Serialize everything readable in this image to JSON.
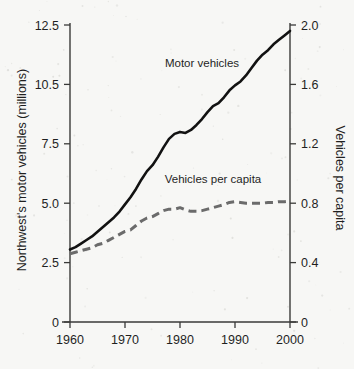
{
  "chart_data": {
    "type": "line",
    "title": "",
    "subtitle": "",
    "xlabel": "",
    "ylabel": "Northwest's motor vehicles (millions)",
    "y2label": "Vehicles per capita",
    "grid": false,
    "legend_position": "inline-annotations",
    "xlim": [
      1960,
      2000
    ],
    "ylim": [
      0,
      12.5
    ],
    "y2lim": [
      0,
      2.0
    ],
    "xticks": [
      1960,
      1970,
      1980,
      1990,
      2000
    ],
    "xticklabels": [
      "1960",
      "1970",
      "1980",
      "1990",
      "2000"
    ],
    "yticks": [
      0,
      2.5,
      5.0,
      7.5,
      10.5,
      12.5
    ],
    "yticklabels": [
      "0",
      "2.5",
      "5.0",
      "7.5",
      "10.5",
      "12.5"
    ],
    "y2ticks": [
      0,
      0.4,
      0.8,
      1.2,
      1.6,
      2.0
    ],
    "y2ticklabels": [
      "0",
      "0.4",
      "0.8",
      "1.2",
      "1.6",
      "2.0"
    ],
    "annotations": [
      {
        "text": "Motor vehicles",
        "x": 1984,
        "y": 11.1
      },
      {
        "text": "Vehicles per capita",
        "x": 1986,
        "y": 5.85
      }
    ],
    "x": [
      1960,
      1961,
      1962,
      1963,
      1964,
      1965,
      1966,
      1967,
      1968,
      1969,
      1970,
      1971,
      1972,
      1973,
      1974,
      1975,
      1976,
      1977,
      1978,
      1979,
      1980,
      1981,
      1982,
      1983,
      1984,
      1985,
      1986,
      1987,
      1988,
      1989,
      1990,
      1991,
      1992,
      1993,
      1994,
      1995,
      1996,
      1997,
      1998,
      1999,
      2000
    ],
    "series": [
      {
        "name": "Motor vehicles",
        "axis": "left",
        "style": "solid",
        "color": "#121212",
        "units": "millions",
        "values": [
          3.05,
          3.15,
          3.3,
          3.45,
          3.6,
          3.8,
          4.0,
          4.2,
          4.4,
          4.65,
          4.95,
          5.25,
          5.6,
          6.0,
          6.35,
          6.6,
          6.95,
          7.35,
          7.75,
          8.0,
          8.1,
          8.05,
          8.2,
          8.45,
          8.75,
          9.1,
          9.4,
          9.55,
          9.85,
          10.2,
          10.45,
          10.6,
          10.8,
          11.05,
          11.3,
          11.5,
          11.65,
          11.85,
          12.0,
          12.15,
          12.3
        ]
      },
      {
        "name": "Vehicles per capita",
        "axis": "right",
        "style": "dashed",
        "color": "#6b6b6b",
        "units": "vehicles per person",
        "values": [
          0.46,
          0.47,
          0.48,
          0.49,
          0.5,
          0.52,
          0.53,
          0.55,
          0.57,
          0.59,
          0.61,
          0.62,
          0.65,
          0.68,
          0.7,
          0.71,
          0.73,
          0.75,
          0.76,
          0.76,
          0.77,
          0.755,
          0.745,
          0.745,
          0.75,
          0.76,
          0.77,
          0.78,
          0.79,
          0.805,
          0.81,
          0.805,
          0.8,
          0.8,
          0.8,
          0.8,
          0.805,
          0.805,
          0.81,
          0.81,
          0.815
        ]
      }
    ]
  }
}
